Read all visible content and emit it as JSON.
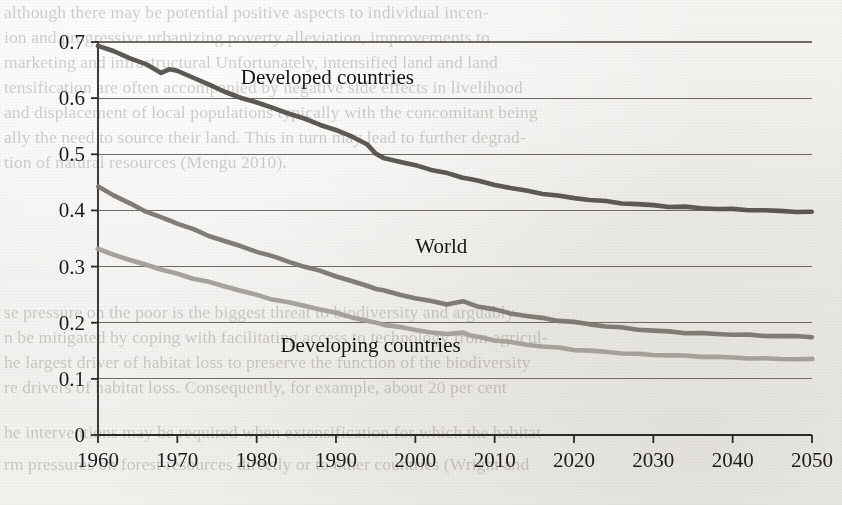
{
  "page": {
    "kind": "scanned-book-page",
    "background_color": "#f1f0ed"
  },
  "bleed_through_text": {
    "note": "faint mirrored text showing through from the reverse side of the scanned page",
    "top_block": [
      "although there may be potential positive aspects to individual incen-",
      "ion and progressive urbanizing poverty alleviation, improvements to",
      "marketing and infrastructural Unfortunately, intensified land and land",
      "tensification are often accompanied by negative side effects in livelihood",
      "and displacement of local populations typically with the concomitant being",
      "ally the need to source their land. This in turn may lead to further degrad-",
      "tion of natural resources (Mengu 2010)."
    ],
    "mid_block": [
      "se pressure on the poor is the biggest threat to biodiversity and arguably",
      "n be mitigated by coping with facilitating access to technology from agricul-",
      "he largest driver of habitat loss to preserve the function of the biodiversity",
      "re drivers of habitat loss. Consequently, for example, about 20 per cent",
      "he interventions may be required when extensification for which the habitat",
      "rm pressures on forest resources directly or to other countries (Wright and"
    ]
  },
  "chart_data": {
    "type": "line",
    "title": "",
    "xlabel": "",
    "ylabel": "",
    "xlim": [
      1960,
      2050
    ],
    "ylim": [
      0,
      0.7
    ],
    "grid": true,
    "grid_orientation": "horizontal",
    "legend_position": "inline-annotations",
    "x_ticks": [
      1960,
      1970,
      1980,
      1990,
      2000,
      2010,
      2020,
      2030,
      2040,
      2050
    ],
    "x_tick_labels": [
      "1960",
      "1970",
      "1980",
      "1990",
      "2000",
      "2010",
      "2020",
      "2030",
      "2040",
      "2050"
    ],
    "y_ticks": [
      0,
      0.1,
      0.2,
      0.3,
      0.4,
      0.5,
      0.6,
      0.7
    ],
    "y_tick_labels": [
      "0",
      "0.1",
      "0.2",
      "0.3",
      "0.4",
      "0.5",
      "0.6",
      "0.7"
    ],
    "x": [
      1960,
      1962,
      1964,
      1966,
      1968,
      1969,
      1970,
      1972,
      1974,
      1976,
      1978,
      1980,
      1982,
      1984,
      1986,
      1988,
      1990,
      1992,
      1994,
      1995,
      1996,
      1998,
      2000,
      2002,
      2004,
      2006,
      2007,
      2008,
      2010,
      2012,
      2014,
      2016,
      2018,
      2020,
      2022,
      2024,
      2026,
      2028,
      2030,
      2032,
      2034,
      2036,
      2038,
      2040,
      2042,
      2044,
      2046,
      2048,
      2050
    ],
    "series": [
      {
        "name": "Developed countries",
        "color": "#55524d",
        "label_x": 1978,
        "label_y": 0.625,
        "values": [
          0.693,
          0.683,
          0.672,
          0.66,
          0.645,
          0.652,
          0.648,
          0.637,
          0.624,
          0.611,
          0.601,
          0.592,
          0.583,
          0.573,
          0.563,
          0.553,
          0.543,
          0.531,
          0.518,
          0.5,
          0.494,
          0.487,
          0.48,
          0.473,
          0.466,
          0.458,
          0.456,
          0.452,
          0.446,
          0.44,
          0.435,
          0.43,
          0.426,
          0.422,
          0.419,
          0.416,
          0.413,
          0.411,
          0.409,
          0.407,
          0.406,
          0.404,
          0.403,
          0.402,
          0.401,
          0.4,
          0.399,
          0.398,
          0.397
        ]
      },
      {
        "name": "World",
        "color": "#7b7871",
        "label_x": 2000,
        "label_y": 0.325,
        "values": [
          0.443,
          0.427,
          0.412,
          0.399,
          0.387,
          0.382,
          0.377,
          0.366,
          0.355,
          0.345,
          0.336,
          0.327,
          0.318,
          0.309,
          0.3,
          0.292,
          0.283,
          0.274,
          0.265,
          0.261,
          0.257,
          0.25,
          0.244,
          0.238,
          0.233,
          0.238,
          0.233,
          0.229,
          0.223,
          0.217,
          0.212,
          0.208,
          0.204,
          0.201,
          0.197,
          0.194,
          0.191,
          0.188,
          0.186,
          0.184,
          0.182,
          0.181,
          0.18,
          0.179,
          0.178,
          0.177,
          0.176,
          0.176,
          0.175
        ]
      },
      {
        "name": "Developing countries",
        "color": "#a19e98",
        "label_x": 1983,
        "label_y": 0.148,
        "values": [
          0.331,
          0.321,
          0.312,
          0.303,
          0.295,
          0.291,
          0.287,
          0.279,
          0.272,
          0.265,
          0.257,
          0.249,
          0.242,
          0.236,
          0.23,
          0.224,
          0.217,
          0.21,
          0.203,
          0.2,
          0.197,
          0.192,
          0.187,
          0.183,
          0.179,
          0.183,
          0.177,
          0.174,
          0.169,
          0.165,
          0.161,
          0.158,
          0.155,
          0.152,
          0.15,
          0.148,
          0.146,
          0.144,
          0.143,
          0.142,
          0.141,
          0.14,
          0.139,
          0.138,
          0.137,
          0.136,
          0.136,
          0.135,
          0.135
        ]
      }
    ]
  }
}
